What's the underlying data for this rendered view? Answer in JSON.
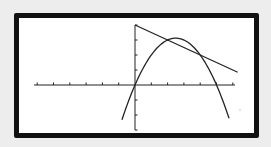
{
  "chart_data": {
    "type": "line",
    "title": "",
    "xlabel": "",
    "ylabel": "",
    "xlim": [
      -6,
      6.2
    ],
    "ylim": [
      -3,
      4
    ],
    "x_tick_step": 1,
    "y_tick_step": 1,
    "grid": false,
    "legend": null,
    "series": [
      {
        "name": "line",
        "equation": "y = 4 - 0.5x",
        "x": [
          0,
          6.3
        ],
        "y": [
          4,
          0.85
        ]
      },
      {
        "name": "parabola",
        "equation": "y = 2.5x - 0.5x^2",
        "x": [
          -0.8,
          0,
          1,
          2,
          2.5,
          3,
          4,
          5,
          5.77
        ],
        "y": [
          -2.32,
          0,
          2,
          3,
          3.125,
          3,
          2,
          0,
          -2.2
        ]
      }
    ],
    "intersections": [
      {
        "x": 2,
        "y": 3
      },
      {
        "x": 4,
        "y": 2
      }
    ],
    "annotations": []
  },
  "colors": {
    "background": "#ededed",
    "frame": "#111111",
    "screen": "#ffffff",
    "curve": "#222222"
  }
}
